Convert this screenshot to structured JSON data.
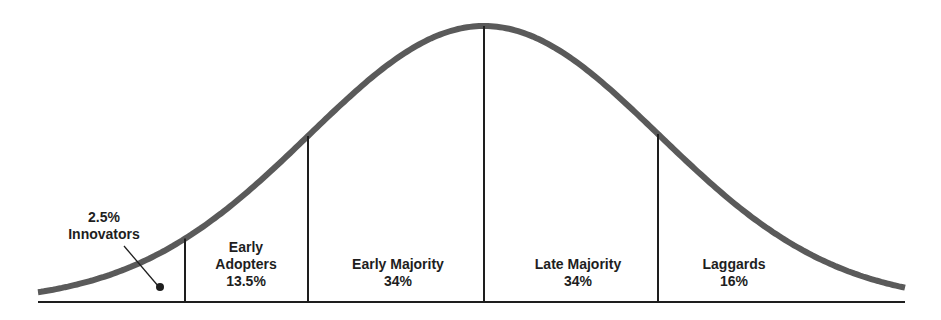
{
  "diagram": {
    "colors": {
      "curve": "#5a5a5a",
      "lines": "#1e1e1e",
      "text": "#1e1e1e",
      "background": "#ffffff"
    },
    "segments": [
      {
        "name": "Innovators",
        "percent": "2.5%",
        "line1": "2.5%",
        "line2": "Innovators"
      },
      {
        "name": "Early Adopters",
        "percent": "13.5%",
        "line1": "Early",
        "line2": "Adopters",
        "line3": "13.5%"
      },
      {
        "name": "Early Majority",
        "percent": "34%",
        "line1": "Early Majority",
        "line2": "34%"
      },
      {
        "name": "Late Majority",
        "percent": "34%",
        "line1": "Late Majority",
        "line2": "34%"
      },
      {
        "name": "Laggards",
        "percent": "16%",
        "line1": "Laggards",
        "line2": "16%"
      }
    ]
  },
  "chart_data": {
    "type": "area",
    "title": "",
    "categories": [
      "Innovators",
      "Early Adopters",
      "Early Majority",
      "Late Majority",
      "Laggards"
    ],
    "values": [
      2.5,
      13.5,
      34,
      34,
      16
    ],
    "xlabel": "",
    "ylabel": "",
    "grid": false,
    "legend": "none"
  }
}
